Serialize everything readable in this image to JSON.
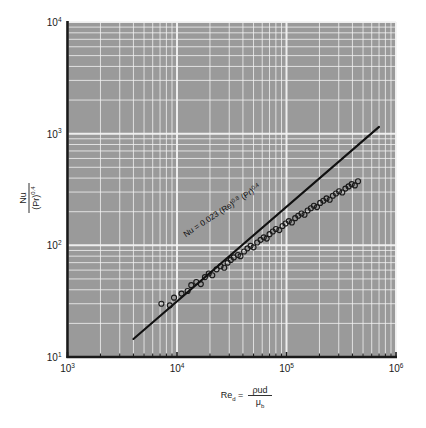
{
  "figure": {
    "top_strip_text": "",
    "background_color": "#ffffff",
    "plot_background_color": "#9a9a9a",
    "grid_color": "#f2f2f2",
    "axis_color": "#1a1a1a",
    "marker_color": "#1a1a1a",
    "line_color": "#111111"
  },
  "chart_data": {
    "type": "scatter",
    "title": "",
    "subtitle": "",
    "xlabel": "Re_d = ρud/μ_b",
    "xlabel_parts": {
      "symbol": "Re",
      "subscript": "d",
      "equals": "=",
      "numerator": "ρud",
      "denominator": "μ",
      "denominator_sub": "b"
    },
    "ylabel": "Nu/(Pr)^0.4",
    "ylabel_parts": {
      "numerator": "Nu",
      "denominator": "(Pr)",
      "denominator_exp": "0.4"
    },
    "xscale": "log",
    "yscale": "log",
    "xlim": [
      1000,
      1000000
    ],
    "ylim": [
      10,
      10000
    ],
    "xticks": [
      1000,
      10000,
      100000,
      1000000
    ],
    "xtick_labels": [
      "10³",
      "10⁴",
      "10⁵",
      "10⁶"
    ],
    "xtick_base": [
      "10",
      "10",
      "10",
      "10"
    ],
    "xtick_exp": [
      "3",
      "4",
      "5",
      "6"
    ],
    "yticks": [
      10,
      100,
      1000,
      10000
    ],
    "ytick_labels": [
      "10¹",
      "10²",
      "10³",
      "10⁴"
    ],
    "ytick_base": [
      "10",
      "10",
      "10",
      "10"
    ],
    "ytick_exp": [
      "1",
      "2",
      "3",
      "4"
    ],
    "grid": true,
    "grid_minor": true,
    "legend": null,
    "annotation": {
      "text": "Nu = 0.023 (Re)^0.8 (Pr)^0.4",
      "parts": {
        "lead": "Nu = 0.023 (Re)",
        "exp1": "0.8",
        "mid": " (Pr)",
        "exp2": "0.4"
      },
      "rotation_deg": -33
    },
    "fit_line": {
      "equation": "Nu/(Pr)^0.4 = 0.023 (Re)^0.8",
      "slope": 0.8,
      "coefficient": 0.023,
      "x_start": 4000,
      "y_start": 14.5,
      "x_end": 700000,
      "y_end": 1150
    },
    "series": [
      {
        "name": "Experimental data",
        "marker": "open-circle",
        "x": [
          7200,
          8600,
          9400,
          11000,
          12500,
          13500,
          15000,
          16500,
          18000,
          19500,
          21000,
          23000,
          25000,
          27000,
          29000,
          31000,
          33000,
          36000,
          38000,
          41000,
          44000,
          47000,
          50000,
          54000,
          58000,
          62000,
          66000,
          70000,
          75000,
          80000,
          86000,
          92000,
          98000,
          105000,
          112000,
          120000,
          128000,
          137000,
          146000,
          156000,
          167000,
          178000,
          190000,
          203000,
          217000,
          232000,
          248000,
          265000,
          283000,
          302000,
          323000,
          345000,
          369000,
          394000,
          421000,
          450000
        ],
        "y": [
          30,
          29,
          34,
          37,
          39,
          44,
          47,
          45,
          52,
          56,
          54,
          61,
          65,
          63,
          70,
          74,
          78,
          82,
          80,
          88,
          94,
          99,
          96,
          106,
          112,
          118,
          115,
          126,
          133,
          140,
          137,
          149,
          157,
          165,
          160,
          175,
          184,
          193,
          188,
          205,
          215,
          226,
          220,
          240,
          251,
          263,
          256,
          278,
          291,
          305,
          297,
          322,
          337,
          353,
          344,
          375
        ]
      }
    ]
  }
}
